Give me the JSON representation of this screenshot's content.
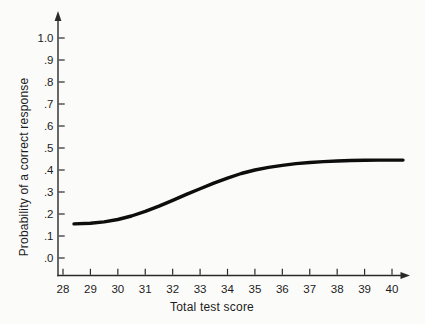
{
  "figure": {
    "background": "#fbfbfa",
    "ink": "#1c1c1c",
    "axis_color": "#2a2a2a"
  },
  "chart_data": {
    "type": "line",
    "title": "",
    "xlabel": "Total test score",
    "ylabel": "Probability of a correct response",
    "xlim": [
      27.8,
      40.6
    ],
    "ylim": [
      0,
      1.0
    ],
    "grid": false,
    "legend_position": "none",
    "axis_arrows": true,
    "x_ticks": [
      28,
      29,
      30,
      31,
      32,
      33,
      34,
      35,
      36,
      37,
      38,
      39,
      40
    ],
    "y_ticks": [
      {
        "v": 0.0,
        "label": ".0"
      },
      {
        "v": 0.1,
        "label": ".1"
      },
      {
        "v": 0.2,
        "label": ".2"
      },
      {
        "v": 0.3,
        "label": ".3"
      },
      {
        "v": 0.4,
        "label": ".4"
      },
      {
        "v": 0.5,
        "label": ".5"
      },
      {
        "v": 0.6,
        "label": ".6"
      },
      {
        "v": 0.7,
        "label": ".7"
      },
      {
        "v": 0.8,
        "label": ".8"
      },
      {
        "v": 0.9,
        "label": ".9"
      },
      {
        "v": 1.0,
        "label": "1.0"
      }
    ],
    "series": [
      {
        "name": "item characteristic curve",
        "color": "#0d0d0d",
        "stroke_width": 3.4,
        "points": [
          [
            28.4,
            0.155
          ],
          [
            29.0,
            0.158
          ],
          [
            29.5,
            0.164
          ],
          [
            30.0,
            0.175
          ],
          [
            30.5,
            0.191
          ],
          [
            31.0,
            0.212
          ],
          [
            31.5,
            0.236
          ],
          [
            32.0,
            0.262
          ],
          [
            32.5,
            0.289
          ],
          [
            33.0,
            0.315
          ],
          [
            33.5,
            0.34
          ],
          [
            34.0,
            0.363
          ],
          [
            34.5,
            0.384
          ],
          [
            35.0,
            0.4
          ],
          [
            35.5,
            0.412
          ],
          [
            36.0,
            0.421
          ],
          [
            36.5,
            0.429
          ],
          [
            37.0,
            0.434
          ],
          [
            37.5,
            0.438
          ],
          [
            38.0,
            0.441
          ],
          [
            38.5,
            0.443
          ],
          [
            39.0,
            0.444
          ],
          [
            39.5,
            0.445
          ],
          [
            40.0,
            0.445
          ],
          [
            40.4,
            0.445
          ]
        ]
      }
    ]
  }
}
